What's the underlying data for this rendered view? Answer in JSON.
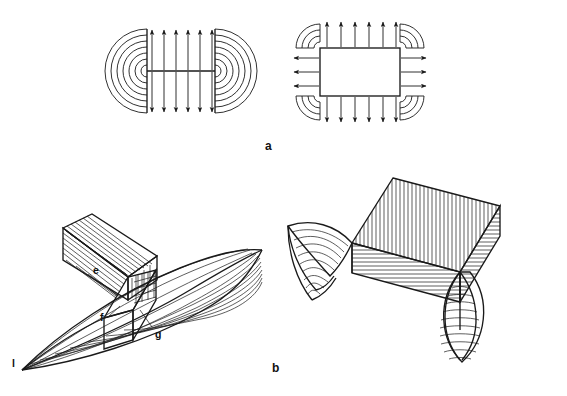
{
  "figure": {
    "background_color": "#ffffff",
    "ink_color": "#1a1a1a",
    "width": 567,
    "height": 396
  },
  "panels": [
    {
      "id": "a",
      "label": "a",
      "label_x": 265,
      "label_y": 150,
      "description": "Two two-dimensional flux/field line diagrams",
      "subfigures": [
        {
          "id": "a-left",
          "name": "line-source-field-diagram",
          "description": "Horizontal line segment source with six straight field arrows above and six below, flanked by concentric semicircular arcs at each end",
          "straight_arrows_top": 6,
          "straight_arrows_bottom": 6,
          "arc_count_left": 7,
          "arc_count_right": 7,
          "source_line_x1": 147,
          "source_line_x2": 215,
          "source_line_y": 71
        },
        {
          "id": "a-right",
          "name": "rectangular-source-field-diagram",
          "description": "Rectangle source with outward arrows on all four edges and quarter-circle arc fans at each corner",
          "arrows_top": 6,
          "arrows_bottom": 6,
          "arrows_left": 3,
          "arrows_right": 3,
          "arcs_per_corner": 4,
          "rect_x": 320,
          "rect_y": 48,
          "rect_w": 80,
          "rect_h": 48
        }
      ]
    },
    {
      "id": "b",
      "label": "b",
      "label_x": 272,
      "label_y": 372,
      "description": "Two three-dimensional perspective constructions of hatched ray surfaces",
      "subfigures": [
        {
          "id": "b-left",
          "name": "prism-and-curved-ray-surface",
          "description": "Hatched oblique prism joined to a saddle-like curved hatched sheet sweeping down to an apex",
          "labels": [
            {
              "text": "e",
              "x": 93,
              "y": 274,
              "meaning": "prism-face-label"
            },
            {
              "text": "f",
              "x": 100,
              "y": 321,
              "meaning": "edge-vertex-label"
            },
            {
              "text": "g",
              "x": 155,
              "y": 338,
              "meaning": "surface-label"
            },
            {
              "text": "l",
              "x": 12,
              "y": 367,
              "meaning": "apex-line-label"
            }
          ]
        },
        {
          "id": "b-right",
          "name": "double-fan-ray-surface",
          "description": "Rhombic slab with vertical hatching on its top face, horizontal hatching on its lower face, and two fan-shaped radially hatched caustic surfaces at the left edge and bottom vertex",
          "labels": []
        }
      ]
    }
  ],
  "caption": {
    "text": ""
  }
}
